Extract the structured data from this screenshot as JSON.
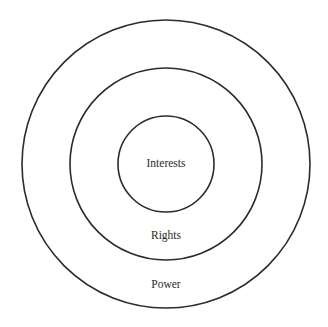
{
  "diagram": {
    "type": "concentric-circles",
    "center": {
      "x": 166,
      "y": 164
    },
    "stroke_color": "#2b2b2b",
    "rings": [
      {
        "name": "outer",
        "radius": 144,
        "label": "Power",
        "label_y": 288
      },
      {
        "name": "middle",
        "radius": 96,
        "label": "Rights",
        "label_y": 239
      },
      {
        "name": "inner",
        "radius": 48,
        "label": "Interests",
        "label_y": 167
      }
    ]
  }
}
